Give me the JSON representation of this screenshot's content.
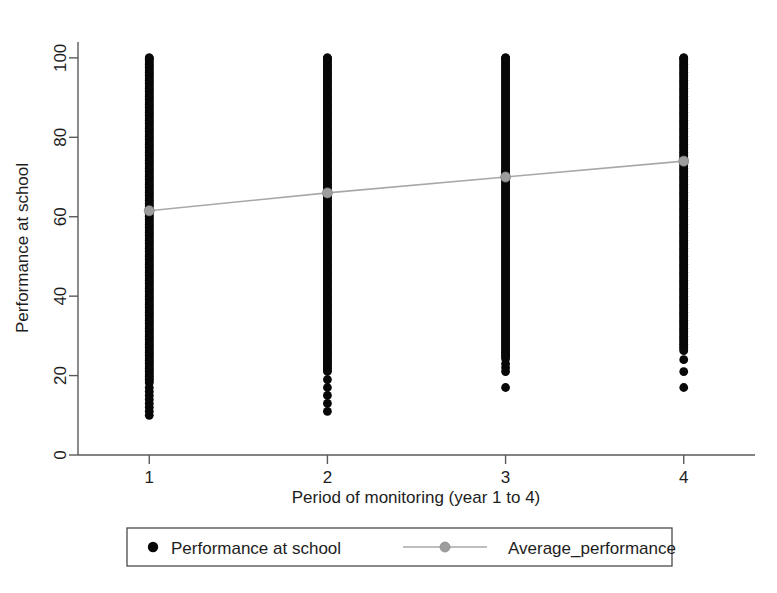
{
  "chart_data": {
    "type": "scatter",
    "title": "",
    "xlabel": "Period of monitoring (year 1 to 4)",
    "ylabel": "Performance at school",
    "xlim": [
      0.6,
      4.4
    ],
    "ylim": [
      0,
      104
    ],
    "xticks": [
      "1",
      "2",
      "3",
      "4"
    ],
    "xtick_values": [
      1,
      2,
      3,
      4
    ],
    "yticks": [
      "0",
      "20",
      "40",
      "60",
      "80",
      "100"
    ],
    "ytick_values": [
      0,
      20,
      40,
      60,
      80,
      100
    ],
    "grid": false,
    "legend_position": "below-axis",
    "series": [
      {
        "name": "Performance at school",
        "type": "scatter",
        "marker": "filled-circle",
        "color": "#080808",
        "x": [
          1,
          2,
          3,
          4
        ],
        "description": "Dense vertical columns of individual pupil scores at each monitoring period",
        "columns": [
          {
            "x": 1,
            "min": 10,
            "max": 100,
            "dense_from": 18,
            "dense_to": 100,
            "sparse_points": [
              10,
              11,
              12,
              13,
              14,
              15,
              16,
              17
            ]
          },
          {
            "x": 2,
            "min": 11,
            "max": 100,
            "dense_from": 21,
            "dense_to": 100,
            "sparse_points": [
              11,
              13,
              15,
              17,
              19
            ]
          },
          {
            "x": 3,
            "min": 17,
            "max": 100,
            "dense_from": 24,
            "dense_to": 100,
            "sparse_points": [
              17,
              21,
              22,
              23
            ]
          },
          {
            "x": 4,
            "min": 17,
            "max": 100,
            "dense_from": 26,
            "dense_to": 100,
            "sparse_points": [
              17,
              21,
              24
            ]
          }
        ]
      },
      {
        "name": "Average_performance",
        "type": "line",
        "marker": "filled-circle",
        "color": "#a8a8a8",
        "x": [
          1,
          2,
          3,
          4
        ],
        "values": [
          61.5,
          66,
          70,
          74
        ]
      }
    ]
  },
  "legend": {
    "entries": [
      {
        "label": "Performance at school",
        "marker": "dot",
        "color": "#080808"
      },
      {
        "label": "Average_performance",
        "marker": "line-dot",
        "color": "#a8a8a8"
      }
    ]
  }
}
